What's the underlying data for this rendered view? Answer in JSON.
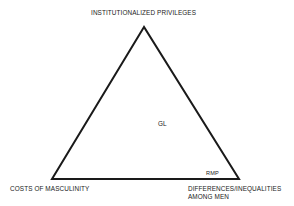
{
  "diagram": {
    "type": "triangle",
    "vertices": {
      "top": {
        "label": "INSTITUTIONALIZED PRIVILEGES"
      },
      "bottom_left": {
        "label": "COSTS OF MASCULINITY"
      },
      "bottom_right": {
        "label_line1": "DIFFERENCES/INEQUALITIES",
        "label_line2": "AMONG MEN"
      }
    },
    "interior_labels": {
      "center": "GL",
      "near_bottom_right": "RMP"
    },
    "stroke_color": "#1a1a1a",
    "background": "#ffffff"
  }
}
